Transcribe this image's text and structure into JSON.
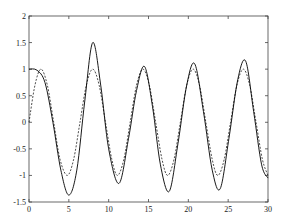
{
  "chart_data": {
    "type": "line",
    "title": "",
    "xlabel": "",
    "ylabel": "",
    "xlim": [
      0,
      30
    ],
    "ylim": [
      -1.5,
      2
    ],
    "grid": false,
    "legend": null,
    "xticks": [
      0,
      5,
      10,
      15,
      20,
      25,
      30
    ],
    "xtick_labels": [
      "0",
      "5",
      "10",
      "15",
      "20",
      "25",
      "30"
    ],
    "yticks": [
      -1.5,
      -1,
      -0.5,
      0,
      0.5,
      1,
      1.5,
      2
    ],
    "ytick_labels": [
      "-1.5",
      "-1",
      "-0.5",
      "0",
      "0.5",
      "1",
      "1.5",
      "2"
    ],
    "series": [
      {
        "name": "solid",
        "style": "solid",
        "color": "#000000",
        "x": [
          0,
          1,
          2,
          3,
          4,
          5,
          6,
          7,
          8,
          9,
          10,
          11.3,
          12.5,
          13.5,
          14.5,
          15.5,
          16.5,
          17.6,
          18.7,
          19.8,
          20.8,
          21.9,
          23,
          24,
          25.1,
          26.2,
          27.2,
          28.2,
          29.2,
          30
        ],
        "y": [
          1.0,
          0.98,
          0.75,
          0.0,
          -0.9,
          -1.37,
          -0.9,
          0.4,
          1.5,
          0.7,
          -0.5,
          -1.15,
          -0.3,
          0.6,
          1.05,
          0.3,
          -0.8,
          -1.3,
          -0.4,
          0.7,
          1.1,
          0.2,
          -0.9,
          -1.25,
          -0.3,
          0.8,
          1.15,
          0.2,
          -0.8,
          -1.05
        ]
      },
      {
        "name": "dashed",
        "style": "dashed",
        "color": "#000000",
        "x": [
          0,
          0.75,
          1.5,
          2.3,
          3.1,
          3.9,
          4.8,
          5.6,
          6.4,
          7.2,
          8.0,
          8.8,
          9.6,
          10.4,
          11.1,
          11.9,
          12.7,
          13.5,
          14.3,
          15.1,
          15.9,
          16.7,
          17.4,
          18.2,
          19.0,
          19.8,
          20.6,
          21.4,
          22.2,
          23.0,
          23.7,
          24.5,
          25.3,
          26.1,
          26.9,
          27.7,
          28.5,
          29.3,
          30
        ],
        "y": [
          0.0,
          0.7,
          1.0,
          0.7,
          0.0,
          -0.7,
          -1.0,
          -0.7,
          0.0,
          0.7,
          1.0,
          0.7,
          0.0,
          -0.7,
          -1.0,
          -0.7,
          0.0,
          0.7,
          1.0,
          0.7,
          0.0,
          -0.7,
          -1.0,
          -0.7,
          0.0,
          0.7,
          1.0,
          0.7,
          0.0,
          -0.7,
          -1.0,
          -0.7,
          0.0,
          0.7,
          1.0,
          0.7,
          0.0,
          -0.7,
          -1.0
        ]
      }
    ]
  },
  "layout": {
    "plot_left": 29,
    "plot_top": 16,
    "plot_right": 268,
    "plot_bottom": 202
  }
}
